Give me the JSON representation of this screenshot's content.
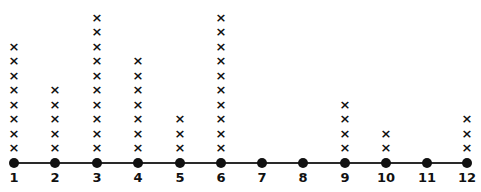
{
  "chart_data": {
    "type": "dot_plot",
    "title": "",
    "xlabel": "",
    "ylabel": "",
    "marker": "x",
    "categories": [
      "1",
      "2",
      "3",
      "4",
      "5",
      "6",
      "7",
      "8",
      "9",
      "10",
      "11",
      "12"
    ],
    "values": [
      8,
      5,
      10,
      7,
      3,
      10,
      0,
      0,
      4,
      2,
      0,
      3
    ],
    "xlim": [
      1,
      12
    ],
    "grid": false,
    "legend": null
  },
  "layout": {
    "tick_x": [
      14,
      55,
      97,
      138,
      180,
      221,
      262,
      303,
      345,
      386,
      427,
      467
    ],
    "base_y": 148,
    "step_y": 14.5
  }
}
